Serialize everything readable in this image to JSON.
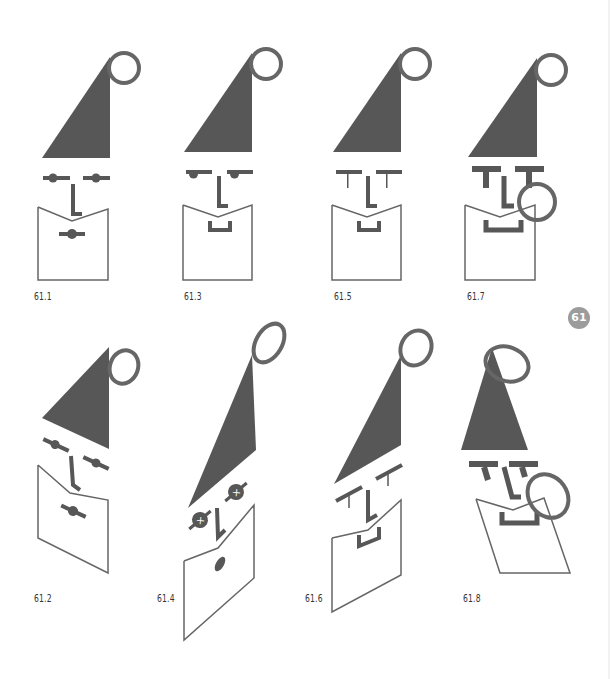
{
  "page": {
    "chapter_badge": "61",
    "colors": {
      "fill": "#575757",
      "stroke": "#666666",
      "badge": "#9c9c9c",
      "label": "#333333"
    }
  },
  "figures": [
    {
      "id": "61.1",
      "label": "61.1",
      "eyes": "bar-with-dot",
      "mouth": "bar-with-dot",
      "variant": "upright"
    },
    {
      "id": "61.2",
      "label": "61.2",
      "eyes": "bar-with-dot",
      "mouth": "bar-with-dot",
      "variant": "skewed-down"
    },
    {
      "id": "61.3",
      "label": "61.3",
      "eyes": "bar-with-half-dot",
      "mouth": "bracket",
      "variant": "upright"
    },
    {
      "id": "61.4",
      "label": "61.4",
      "eyes": "crossed-circle",
      "mouth": "oval",
      "variant": "skewed-up-tall"
    },
    {
      "id": "61.5",
      "label": "61.5",
      "eyes": "thin-t",
      "mouth": "bracket",
      "variant": "upright"
    },
    {
      "id": "61.6",
      "label": "61.6",
      "eyes": "thin-t",
      "mouth": "bracket",
      "variant": "skewed-up"
    },
    {
      "id": "61.7",
      "label": "61.7",
      "eyes": "bold-t",
      "mouth": "bold-bracket",
      "variant": "upright-with-ring"
    },
    {
      "id": "61.8",
      "label": "61.8",
      "eyes": "bold-t",
      "mouth": "bold-bracket",
      "variant": "slanted-with-ring"
    }
  ]
}
